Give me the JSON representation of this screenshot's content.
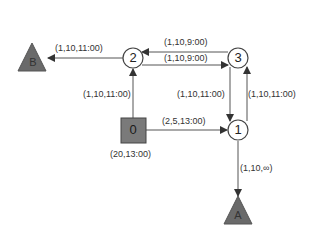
{
  "diagram": {
    "colors": {
      "line": "#555555",
      "node_fill": "#ffffff",
      "depot_fill": "#7a7a7a",
      "triangle_fill": "#6a6a6a",
      "text": "#333333"
    },
    "nodes": [
      {
        "id": "0",
        "label": "0",
        "shape": "square",
        "annotation": "(20,13:00)"
      },
      {
        "id": "1",
        "label": "1",
        "shape": "circle"
      },
      {
        "id": "2",
        "label": "2",
        "shape": "circle"
      },
      {
        "id": "3",
        "label": "3",
        "shape": "circle"
      },
      {
        "id": "A",
        "label": "A",
        "shape": "triangle"
      },
      {
        "id": "B",
        "label": "B",
        "shape": "triangle"
      }
    ],
    "edges": [
      {
        "from": "2",
        "to": "B",
        "label": "(1,10,11:00)"
      },
      {
        "from": "3",
        "to": "2",
        "label": "(1,10,9:00)"
      },
      {
        "from": "2",
        "to": "3",
        "label": "(1,10,9:00)"
      },
      {
        "from": "0",
        "to": "2",
        "label": "(1,10,11:00)"
      },
      {
        "from": "3",
        "to": "1",
        "label": "(1,10,11:00)"
      },
      {
        "from": "1",
        "to": "3",
        "label": "(1,10,11:00)"
      },
      {
        "from": "0",
        "to": "1",
        "label": "(2,5,13:00)"
      },
      {
        "from": "1",
        "to": "A",
        "label": "(1,10,∞)"
      }
    ]
  }
}
